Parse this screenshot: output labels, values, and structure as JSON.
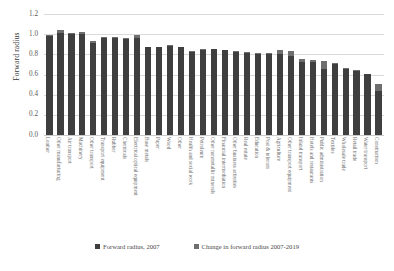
{
  "chart_data": {
    "type": "bar",
    "title": "",
    "xlabel": "",
    "ylabel": "Forward radius",
    "ylim": [
      0.0,
      1.2
    ],
    "yticks": [
      "1.2",
      "1.0",
      "0.8",
      "0.6",
      "0.4",
      "0.2",
      "0.0"
    ],
    "grid": true,
    "stacked": true,
    "legend_position": "bottom",
    "categories": [
      "Leather",
      "Other manufacturing",
      "Air transport",
      "Machinery",
      "Other transport",
      "Transport equipment",
      "Rubber",
      "Chemicals",
      "Electrical optical equipment",
      "Base metals",
      "Paper",
      "Wood",
      "Other",
      "Health and social work",
      "Petroleum",
      "Other nonmetallic minerals",
      "Financial intermediation",
      "Other business activities",
      "Real estate",
      "Education",
      "Post & telecom",
      "Agriculture",
      "Other transport equipment",
      "Inland transport",
      "Hotels and restaurants",
      "Public administration",
      "Textiles",
      "Wholesale trade",
      "Retail trade",
      "Water transport",
      "Construction"
    ],
    "series": [
      {
        "name": "Forward radius, 2007",
        "color": "#3f3f3f",
        "values": [
          0.98,
          1.01,
          1.0,
          1.0,
          0.93,
          0.96,
          0.96,
          0.95,
          0.96,
          0.87,
          0.87,
          0.88,
          0.87,
          0.83,
          0.84,
          0.85,
          0.84,
          0.82,
          0.81,
          0.8,
          0.8,
          0.8,
          0.78,
          0.72,
          0.72,
          0.65,
          0.7,
          0.65,
          0.63,
          0.61,
          0.44
        ]
      },
      {
        "name": "Change in forward radius 2007-2019",
        "color": "#6e6e6e",
        "values": [
          0.01,
          0.03,
          0.01,
          0.02,
          -0.02,
          0.01,
          0.01,
          0.01,
          0.03,
          0.0,
          0.0,
          0.01,
          0.0,
          -0.01,
          0.01,
          0.0,
          0.0,
          0.01,
          0.01,
          0.01,
          0.01,
          0.04,
          0.05,
          0.03,
          0.02,
          0.08,
          0.01,
          0.01,
          0.01,
          0.0,
          0.07
        ]
      }
    ],
    "legend": [
      {
        "label": "Forward radius, 2007",
        "color": "#3f3f3f"
      },
      {
        "label": "Change in forward radius 2007-2019",
        "color": "#6e6e6e"
      }
    ]
  }
}
